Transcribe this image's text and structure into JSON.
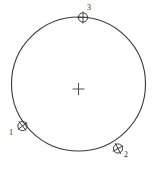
{
  "figure": {
    "type": "geometric-diagram",
    "width": 163,
    "height": 172,
    "background_color": "#ffffff",
    "stroke_color": "#3a3a3a",
    "label_color": "#2b2b2b"
  },
  "circle": {
    "name": "main-circle",
    "center_x": 78.5,
    "center_y": 84,
    "radius": 67,
    "stroke_width": 1.1,
    "fill": "none"
  },
  "center_mark": {
    "name": "center-cross",
    "x": 78.5,
    "y": 89,
    "arm_length": 6,
    "stroke_width": 0.9
  },
  "points": [
    {
      "id": "1",
      "label": "1",
      "marker_x": 22.5,
      "marker_y": 126,
      "marker_radius": 4.6,
      "label_x": 11,
      "label_y": 135
    },
    {
      "id": "2",
      "label": "2",
      "marker_x": 118,
      "marker_y": 148.5,
      "marker_radius": 4.6,
      "label_x": 126,
      "label_y": 157
    },
    {
      "id": "3",
      "label": "3",
      "marker_x": 83,
      "marker_y": 17.5,
      "marker_radius": 4.6,
      "label_x": 89,
      "label_y": 10
    }
  ]
}
